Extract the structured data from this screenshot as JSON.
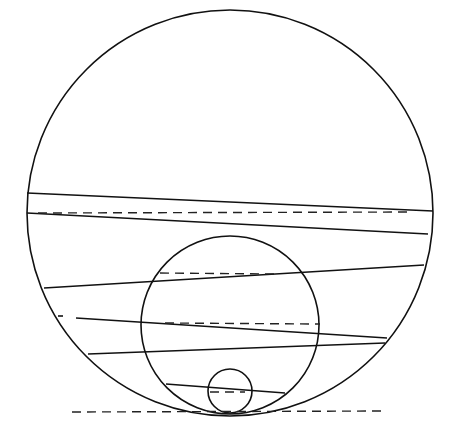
{
  "diagram": {
    "width": 453,
    "height": 434,
    "stroke_color": "#111111",
    "background": "#ffffff",
    "circles": [
      {
        "name": "outer-circle",
        "cx": 230,
        "cy": 213,
        "r": 203
      },
      {
        "name": "middle-circle",
        "cx": 230,
        "cy": 325,
        "r": 89
      },
      {
        "name": "inner-circle",
        "cx": 230,
        "cy": 391,
        "r": 22
      }
    ],
    "solid_lines": [
      {
        "name": "chord-1",
        "x1": 27,
        "y1": 193,
        "x2": 433,
        "y2": 211
      },
      {
        "name": "chord-2",
        "x1": 27,
        "y1": 213,
        "x2": 428,
        "y2": 234
      },
      {
        "name": "chord-3",
        "x1": 44,
        "y1": 288,
        "x2": 424,
        "y2": 265
      },
      {
        "name": "chord-4",
        "x1": 76,
        "y1": 318,
        "x2": 387,
        "y2": 338
      },
      {
        "name": "chord-5",
        "x1": 88,
        "y1": 354,
        "x2": 385,
        "y2": 343
      },
      {
        "name": "chord-6",
        "x1": 166,
        "y1": 384,
        "x2": 285,
        "y2": 393
      },
      {
        "name": "tick-mark",
        "x1": 58,
        "y1": 316,
        "x2": 63,
        "y2": 316
      }
    ],
    "dashed_lines": [
      {
        "name": "outer-diameter-dash",
        "x1": 38,
        "y1": 213,
        "x2": 412,
        "y2": 212
      },
      {
        "name": "middle-upper-dash",
        "x1": 160,
        "y1": 273,
        "x2": 275,
        "y2": 274
      },
      {
        "name": "middle-lower-dash",
        "x1": 165,
        "y1": 323,
        "x2": 320,
        "y2": 324
      },
      {
        "name": "inner-dash",
        "x1": 210,
        "y1": 392,
        "x2": 245,
        "y2": 392
      },
      {
        "name": "tangent-baseline-dash",
        "x1": 72,
        "y1": 412,
        "x2": 386,
        "y2": 411
      }
    ]
  }
}
